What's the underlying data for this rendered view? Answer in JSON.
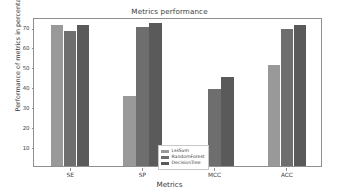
{
  "chart_data": {
    "type": "bar",
    "title": "Metrics performance",
    "xlabel": "Metrics",
    "ylabel": "Performance of metrics in percentage",
    "categories": [
      "SE",
      "SP",
      "MCC",
      "ACC"
    ],
    "ylim": [
      0,
      75
    ],
    "yticks": [
      10,
      20,
      30,
      40,
      50,
      60,
      70
    ],
    "ytick_labels": [
      "10",
      "20",
      "30",
      "40",
      "50",
      "60",
      "70"
    ],
    "grid": false,
    "legend_position": "lower center",
    "series": [
      {
        "name": "LssSvm",
        "color": "#999999",
        "values": [
          71,
          35,
          10,
          51
        ]
      },
      {
        "name": "RandomForest",
        "color": "#6e6e6e",
        "values": [
          68,
          70,
          39,
          69
        ]
      },
      {
        "name": "DecisionTree",
        "color": "#5a5a5a",
        "values": [
          71,
          72,
          45,
          71
        ]
      }
    ]
  },
  "figure": {
    "background_color": "#ffffff",
    "axes_color": "#8f8f8f",
    "text_color": "#3b3b3b"
  }
}
